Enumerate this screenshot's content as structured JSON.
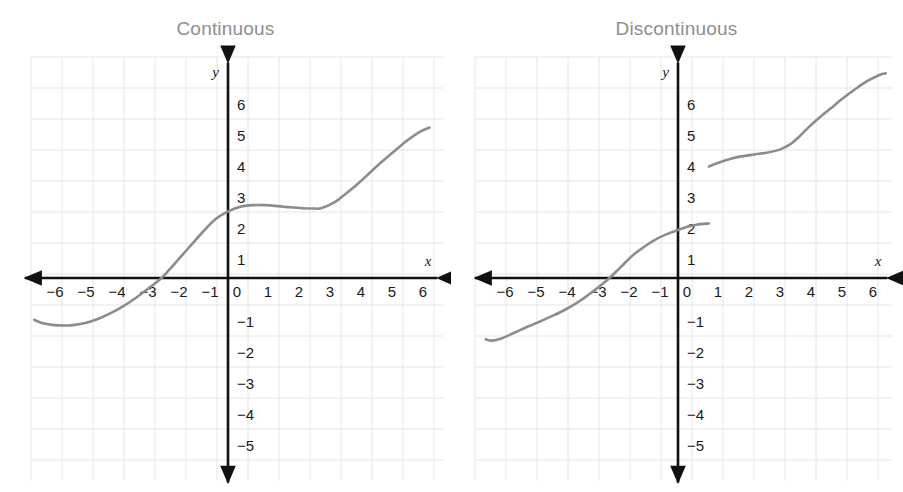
{
  "page": {
    "background_color": "#ffffff",
    "width": 903,
    "height": 492
  },
  "style": {
    "grid_color": "#e6e6e6",
    "axis_color": "#111111",
    "curve_color": "#8c8c8c",
    "title_color": "#8e8e8e",
    "label_color": "#1a1a1a"
  },
  "figures": [
    {
      "id": "continuous",
      "title": "Continuous",
      "x_axis_label": "x",
      "y_axis_label": "y",
      "x_ticks": [
        "-6",
        "-5",
        "-4",
        "-3",
        "-2",
        "-1",
        "0",
        "1",
        "2",
        "3",
        "4",
        "5",
        "6"
      ],
      "y_ticks": [
        "6",
        "5",
        "4",
        "3",
        "2",
        "1",
        "-1",
        "-2",
        "-3",
        "-4",
        "-5"
      ]
    },
    {
      "id": "discontinuous",
      "title": "Discontinuous",
      "x_axis_label": "x",
      "y_axis_label": "y",
      "x_ticks": [
        "-6",
        "-5",
        "-4",
        "-3",
        "-2",
        "-1",
        "0",
        "1",
        "2",
        "3",
        "4",
        "5",
        "6"
      ],
      "y_ticks": [
        "6",
        "5",
        "4",
        "3",
        "2",
        "1",
        "-1",
        "-2",
        "-3",
        "-4",
        "-5"
      ]
    }
  ],
  "chart_data": [
    {
      "type": "line",
      "title": "Continuous",
      "xlabel": "x",
      "ylabel": "y",
      "xlim": [
        -6.6,
        6.8
      ],
      "ylim": [
        -5.6,
        6.8
      ],
      "xticks": [
        -6,
        -5,
        -4,
        -3,
        -2,
        -1,
        0,
        1,
        2,
        3,
        4,
        5,
        6
      ],
      "yticks": [
        -5,
        -4,
        -3,
        -2,
        -1,
        1,
        2,
        3,
        4,
        5,
        6
      ],
      "grid": true,
      "legend": "none",
      "annotation": "A single unbroken curve with no jumps or holes.",
      "series": [
        {
          "name": "f(x)",
          "x": [
            -6.25,
            -6.0,
            -5.6,
            -5.2,
            -5.0,
            -4.6,
            -4.2,
            -3.8,
            -3.4,
            -3.0,
            -2.6,
            -2.2,
            -1.9,
            -1.6,
            -1.2,
            -0.8,
            -0.4,
            0.0,
            0.4,
            0.8,
            1.2,
            1.6,
            2.0,
            2.4,
            2.8,
            3.0,
            3.4,
            3.8,
            4.2,
            4.6,
            5.0,
            5.4,
            5.8,
            6.2,
            6.5
          ],
          "y": [
            -1.35,
            -1.45,
            -1.52,
            -1.53,
            -1.52,
            -1.45,
            -1.32,
            -1.14,
            -0.92,
            -0.66,
            -0.36,
            -0.05,
            0.26,
            0.6,
            1.05,
            1.5,
            1.9,
            2.15,
            2.3,
            2.35,
            2.35,
            2.32,
            2.28,
            2.25,
            2.24,
            2.25,
            2.42,
            2.72,
            3.05,
            3.42,
            3.78,
            4.12,
            4.45,
            4.72,
            4.85
          ]
        }
      ]
    },
    {
      "type": "line",
      "title": "Discontinuous",
      "xlabel": "x",
      "ylabel": "y",
      "xlim": [
        -6.6,
        6.8
      ],
      "ylim": [
        -5.6,
        6.8
      ],
      "xticks": [
        -6,
        -5,
        -4,
        -3,
        -2,
        -1,
        0,
        1,
        2,
        3,
        4,
        5,
        6
      ],
      "yticks": [
        -5,
        -4,
        -3,
        -2,
        -1,
        1,
        2,
        3,
        4,
        5,
        6
      ],
      "grid": true,
      "legend": "none",
      "annotation": "A jump discontinuity at x = 1: the curve breaks from y = 1.75 up to y = 3.6.",
      "discontinuity": {
        "x": 1.0,
        "y_left": 1.75,
        "y_right": 3.6,
        "jump": 1.85
      },
      "series": [
        {
          "name": "f(x) branch 1 (x < 1)",
          "x": [
            -6.2,
            -6.0,
            -5.7,
            -5.4,
            -5.1,
            -4.8,
            -4.4,
            -4.0,
            -3.6,
            -3.2,
            -2.9,
            -2.6,
            -2.3,
            -2.0,
            -1.7,
            -1.4,
            -1.1,
            -0.8,
            -0.4,
            0.0,
            0.3,
            0.6,
            1.0
          ],
          "y": [
            -1.98,
            -2.02,
            -1.95,
            -1.82,
            -1.68,
            -1.55,
            -1.38,
            -1.2,
            -1.0,
            -0.76,
            -0.55,
            -0.32,
            -0.08,
            0.2,
            0.5,
            0.78,
            1.0,
            1.2,
            1.4,
            1.55,
            1.65,
            1.72,
            1.76
          ]
        },
        {
          "name": "f(x) branch 2 (x > 1)",
          "x": [
            1.0,
            1.3,
            1.7,
            2.1,
            2.5,
            2.9,
            3.3,
            3.6,
            3.9,
            4.2,
            4.5,
            4.9,
            5.3,
            5.7,
            6.1,
            6.5,
            6.7
          ],
          "y": [
            3.6,
            3.72,
            3.85,
            3.93,
            3.99,
            4.05,
            4.15,
            4.3,
            4.55,
            4.85,
            5.12,
            5.45,
            5.78,
            6.08,
            6.35,
            6.55,
            6.6
          ]
        }
      ]
    }
  ]
}
